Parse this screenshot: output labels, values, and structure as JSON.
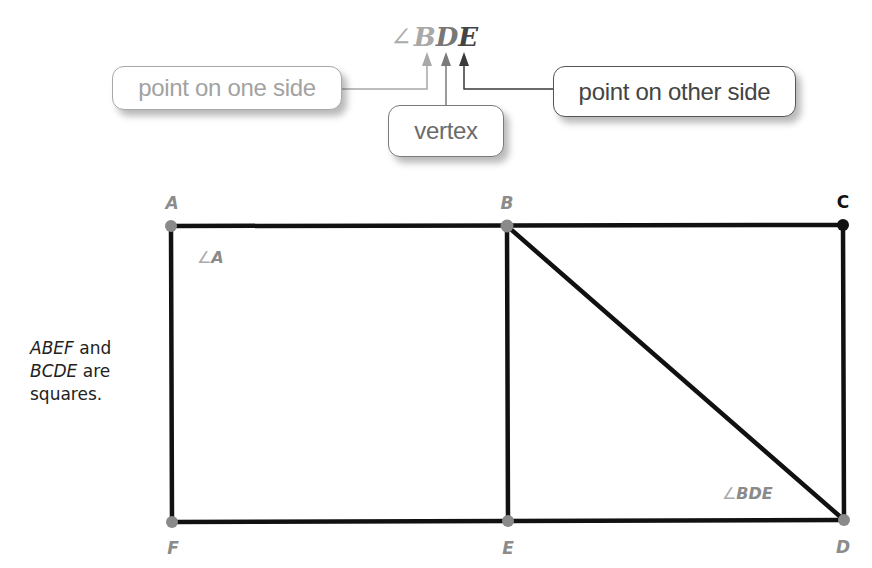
{
  "header": {
    "angle_symbol": "∠",
    "angle_letters": [
      "B",
      "D",
      "E"
    ]
  },
  "callouts": {
    "point_one_side": "point on one side",
    "vertex": "vertex",
    "point_other_side": "point on other side"
  },
  "figure": {
    "points": {
      "A": {
        "label": "A",
        "x": 171,
        "y": 226
      },
      "B": {
        "label": "B",
        "x": 507,
        "y": 226
      },
      "C": {
        "label": "C",
        "x": 843,
        "y": 225
      },
      "D": {
        "label": "D",
        "x": 844,
        "y": 520
      },
      "E": {
        "label": "E",
        "x": 508,
        "y": 521
      },
      "F": {
        "label": "F",
        "x": 172,
        "y": 522
      }
    },
    "angle_labels": {
      "angle_a": {
        "symbol": "∠",
        "letters": "A"
      },
      "angle_bde": {
        "symbol": "∠",
        "letters": "BDE"
      }
    },
    "note": {
      "line1_italic": "ABEF",
      "line1_rest": " and",
      "line2_italic": "BCDE",
      "line2_rest": " are",
      "line3": "squares."
    }
  },
  "colors": {
    "line": "#111111",
    "point_gray": "#8a8a8a",
    "point_black": "#111111",
    "arrow_light": "#a8a8a8",
    "arrow_mid": "#7a7a7a",
    "arrow_dark": "#3a3a3a"
  }
}
